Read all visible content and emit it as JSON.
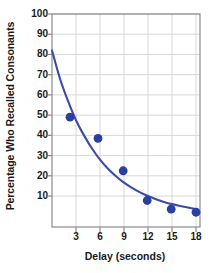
{
  "chart_data": {
    "type": "scatter",
    "title": "",
    "subtitle": "",
    "xlabel": "Delay (seconds)",
    "ylabel": "Percentage Who Recalled Consonants",
    "xlim": [
      0,
      18.5
    ],
    "ylim": [
      -5.3,
      100
    ],
    "xticks": [
      3,
      6,
      9,
      12,
      15,
      18
    ],
    "yticks": [
      10,
      20,
      30,
      40,
      50,
      60,
      70,
      80,
      90,
      100
    ],
    "xtick_labels": [
      "3",
      "6",
      "9",
      "12",
      "15",
      "18"
    ],
    "ytick_labels": [
      "10",
      "20",
      "30",
      "40",
      "50",
      "60",
      "70",
      "80",
      "90",
      "100"
    ],
    "grid": true,
    "legend": "none",
    "x": [
      2.25,
      5.75,
      8.9,
      11.9,
      14.9,
      18.0
    ],
    "values": [
      49,
      38.5,
      22.5,
      7.8,
      3.5,
      2.0
    ],
    "series": [
      {
        "name": "Recall data points",
        "marker": "circle",
        "color": "#2b3f9e",
        "x": [
          2.25,
          5.75,
          8.9,
          11.9,
          14.9,
          18.0
        ],
        "values": [
          49,
          38.5,
          22.5,
          7.8,
          3.5,
          2.0
        ]
      },
      {
        "name": "Fitted decay curve",
        "marker": "none",
        "color": "#3b4ba8",
        "x": [
          0,
          1,
          2,
          3,
          4,
          5,
          6,
          7,
          8,
          9,
          10,
          11,
          12,
          13,
          14,
          15,
          16,
          17,
          18
        ],
        "values": [
          82,
          68,
          57,
          47.5,
          40,
          33.5,
          28,
          23.5,
          19.8,
          16.6,
          14,
          11.8,
          10,
          8.4,
          7.1,
          6.0,
          5.1,
          4.3,
          3.6
        ]
      }
    ],
    "colors": {
      "marker": "#2b3f9e",
      "curve": "#3b4ba8",
      "grid": "#d8d8d8",
      "axis": "#8a8a8a",
      "text": "#1a1a1a",
      "background": "#ffffff"
    }
  }
}
